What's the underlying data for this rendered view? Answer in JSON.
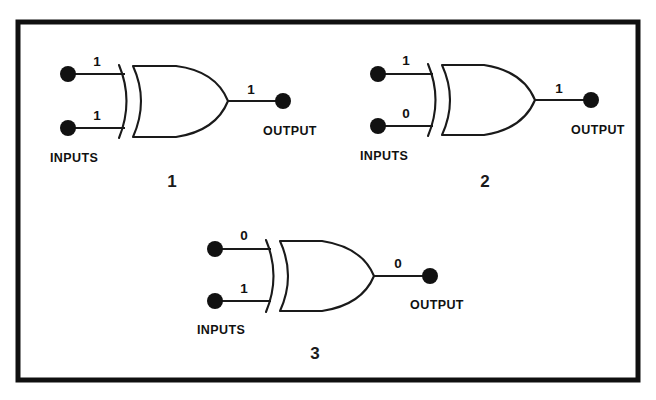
{
  "diagram": {
    "background_color": "#ffffff",
    "border_color": "#101010",
    "line_color": "#1a1a1a",
    "dot_color": "#111111",
    "gates": [
      {
        "figure_number": "1",
        "gate_type": "XOR",
        "inputs_label": "INPUTS",
        "output_label": "OUTPUT",
        "input_a": "1",
        "input_b": "1",
        "output": "1"
      },
      {
        "figure_number": "2",
        "gate_type": "XOR",
        "inputs_label": "INPUTS",
        "output_label": "OUTPUT",
        "input_a": "1",
        "input_b": "0",
        "output": "1"
      },
      {
        "figure_number": "3",
        "gate_type": "XOR",
        "inputs_label": "INPUTS",
        "output_label": "OUTPUT",
        "input_a": "0",
        "input_b": "1",
        "output": "0"
      }
    ]
  }
}
